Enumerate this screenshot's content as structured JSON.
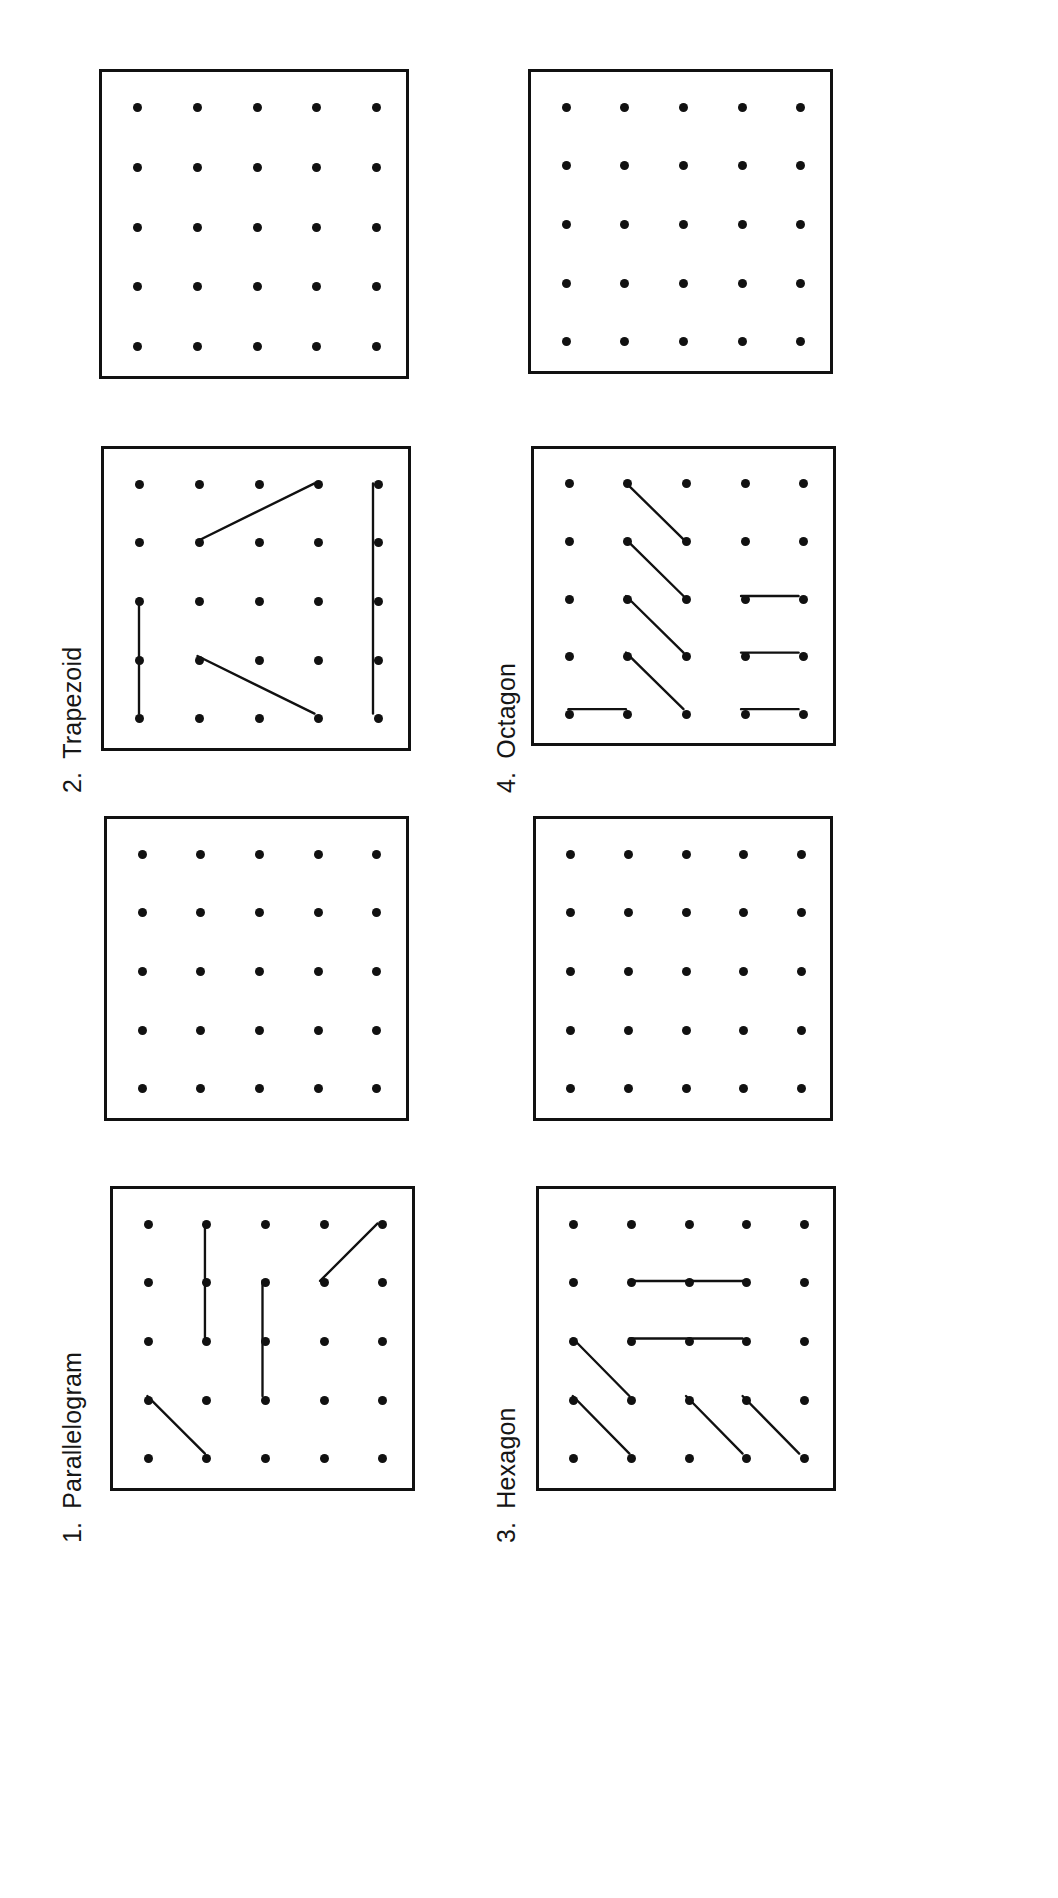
{
  "page": {
    "orientation": "landscape-rotated",
    "background_color": "#ffffff",
    "ink_color": "#111111",
    "worksheet_type": "geoboard dot-grid shapes worksheet",
    "grid_size": "5x5"
  },
  "labels": [
    {
      "id": "label-1",
      "number": "1.",
      "text": "Parallelogram",
      "x": 58,
      "y": 1543
    },
    {
      "id": "label-2",
      "number": "2.",
      "text": "Trapezoid",
      "x": 58,
      "y": 793
    },
    {
      "id": "label-3",
      "number": "3.",
      "text": "Hexagon",
      "x": 492,
      "y": 1543
    },
    {
      "id": "label-4",
      "number": "4.",
      "text": "Octagon",
      "x": 492,
      "y": 793
    }
  ],
  "panels": [
    {
      "id": "panel-parallelogram-answer",
      "name": "parallelogram-answer-board",
      "shape": "Parallelogram",
      "has_drawing": true,
      "x": 110,
      "y": 1186,
      "w": 305,
      "h": 305,
      "segments": [
        {
          "x1": 1,
          "y1": 0,
          "x2": 1,
          "y2": 2
        },
        {
          "x1": 2,
          "y1": 1,
          "x2": 2,
          "y2": 3
        },
        {
          "x1": 3,
          "y1": 1,
          "x2": 4,
          "y2": 0
        },
        {
          "x1": 0,
          "y1": 3,
          "x2": 1,
          "y2": 4
        }
      ]
    },
    {
      "id": "panel-parallelogram-blank",
      "name": "parallelogram-blank-board",
      "shape": "Parallelogram",
      "has_drawing": false,
      "x": 104,
      "y": 816,
      "w": 305,
      "h": 305,
      "segments": []
    },
    {
      "id": "panel-trapezoid-answer",
      "name": "trapezoid-answer-board",
      "shape": "Trapezoid",
      "has_drawing": true,
      "x": 101,
      "y": 446,
      "w": 310,
      "h": 305,
      "segments": [
        {
          "x1": 1,
          "y1": 1,
          "x2": 3,
          "y2": 0
        },
        {
          "x1": 0,
          "y1": 2,
          "x2": 0,
          "y2": 4
        },
        {
          "x1": 1,
          "y1": 3,
          "x2": 3,
          "y2": 4
        },
        {
          "x1": 4,
          "y1": 0,
          "x2": 4,
          "y2": 4
        }
      ]
    },
    {
      "id": "panel-trapezoid-blank",
      "name": "trapezoid-blank-board",
      "shape": "Trapezoid",
      "has_drawing": false,
      "x": 99,
      "y": 69,
      "w": 310,
      "h": 310,
      "segments": []
    },
    {
      "id": "panel-hexagon-answer",
      "name": "hexagon-answer-board",
      "shape": "Hexagon",
      "has_drawing": true,
      "x": 536,
      "y": 1186,
      "w": 300,
      "h": 305,
      "segments": [
        {
          "x1": 1,
          "y1": 1,
          "x2": 3,
          "y2": 1
        },
        {
          "x1": 1,
          "y1": 2,
          "x2": 3,
          "y2": 2
        },
        {
          "x1": 0,
          "y1": 2,
          "x2": 1,
          "y2": 3
        },
        {
          "x1": 0,
          "y1": 3,
          "x2": 1,
          "y2": 4
        },
        {
          "x1": 2,
          "y1": 3,
          "x2": 3,
          "y2": 4
        },
        {
          "x1": 3,
          "y1": 3,
          "x2": 4,
          "y2": 4
        }
      ]
    },
    {
      "id": "panel-hexagon-blank",
      "name": "hexagon-blank-board",
      "shape": "Hexagon",
      "has_drawing": false,
      "x": 533,
      "y": 816,
      "w": 300,
      "h": 305,
      "segments": []
    },
    {
      "id": "panel-octagon-answer",
      "name": "octagon-answer-board",
      "shape": "Octagon",
      "has_drawing": true,
      "x": 531,
      "y": 446,
      "w": 305,
      "h": 300,
      "segments": [
        {
          "x1": 1,
          "y1": 0,
          "x2": 2,
          "y2": 1
        },
        {
          "x1": 1,
          "y1": 1,
          "x2": 2,
          "y2": 2
        },
        {
          "x1": 1,
          "y1": 2,
          "x2": 2,
          "y2": 3
        },
        {
          "x1": 1,
          "y1": 3,
          "x2": 2,
          "y2": 4
        },
        {
          "x1": 3,
          "y1": 2,
          "x2": 4,
          "y2": 2
        },
        {
          "x1": 3,
          "y1": 3,
          "x2": 4,
          "y2": 3
        },
        {
          "x1": 3,
          "y1": 4,
          "x2": 4,
          "y2": 4
        },
        {
          "x1": 0,
          "y1": 4,
          "x2": 1,
          "y2": 4
        }
      ]
    },
    {
      "id": "panel-octagon-blank",
      "name": "octagon-blank-board",
      "shape": "Octagon",
      "has_drawing": false,
      "x": 528,
      "y": 69,
      "w": 305,
      "h": 305,
      "segments": []
    }
  ]
}
